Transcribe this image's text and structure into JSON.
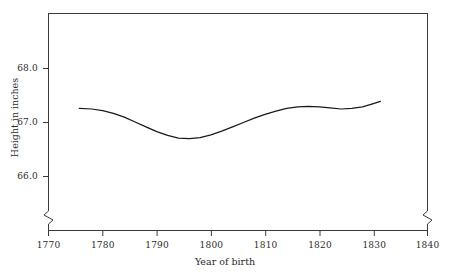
{
  "chart_data": {
    "type": "line",
    "title": "",
    "xlabel": "Year of birth",
    "ylabel": "Height in inches",
    "xlim": [
      1770,
      1840
    ],
    "ylim": [
      65.35,
      68.55
    ],
    "grid": false,
    "legend": null,
    "axis_breaks": {
      "x_left_break": true,
      "x_right_break": true,
      "note": "zig-zag breaks on the left and right vertical frame segments below the data area"
    },
    "xticks": [
      1770,
      1780,
      1790,
      1800,
      1810,
      1820,
      1830,
      1840
    ],
    "xtick_labels": [
      "1770",
      "1780",
      "1790",
      "1800",
      "1810",
      "1820",
      "1830",
      "1840"
    ],
    "yticks": [
      66.0,
      67.0,
      68.0
    ],
    "ytick_labels": [
      "66.0",
      "67.0",
      "68.0"
    ],
    "series": [
      {
        "name": "mean height by year of birth",
        "color": "#1a1a1a",
        "x": [
          1775.7,
          1778,
          1780,
          1782,
          1784,
          1786,
          1788,
          1790,
          1792,
          1794,
          1796,
          1798,
          1800,
          1802,
          1804,
          1806,
          1808,
          1810,
          1812,
          1814,
          1816,
          1818,
          1820,
          1822,
          1824,
          1826,
          1828,
          1830,
          1831.3
        ],
        "values": [
          67.26,
          67.25,
          67.22,
          67.17,
          67.1,
          67.01,
          66.92,
          66.83,
          66.76,
          66.71,
          66.7,
          66.72,
          66.77,
          66.84,
          66.92,
          67.0,
          67.08,
          67.15,
          67.21,
          67.26,
          67.29,
          67.3,
          67.29,
          67.27,
          67.25,
          67.26,
          67.29,
          67.35,
          67.39
        ]
      }
    ]
  },
  "axis": {
    "xlabel": "Year of birth",
    "ylabel": "Height in inches",
    "xtick_labels": [
      "1770",
      "1780",
      "1790",
      "1800",
      "1810",
      "1820",
      "1830",
      "1840"
    ],
    "ytick_labels": [
      "66.0",
      "67.0",
      "68.0"
    ]
  },
  "colors": {
    "line": "#1a1a1a",
    "axis": "#3a3a3a",
    "background": "#ffffff",
    "text": "#2b2b2b"
  }
}
